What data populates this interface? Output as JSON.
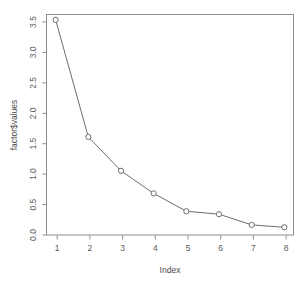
{
  "chart_data": {
    "type": "line",
    "title": "",
    "subtitle": "",
    "xlabel": "Index",
    "ylabel": "factor$values",
    "x": [
      1,
      2,
      3,
      4,
      5,
      6,
      7,
      8
    ],
    "values": [
      3.59,
      1.62,
      1.05,
      0.67,
      0.37,
      0.32,
      0.14,
      0.1
    ],
    "series": [
      {
        "name": "factor$values",
        "values": [
          3.59,
          1.62,
          1.05,
          0.67,
          0.37,
          0.32,
          0.14,
          0.1
        ]
      }
    ],
    "xtick_labels": [
      "1",
      "2",
      "3",
      "4",
      "5",
      "6",
      "7",
      "8"
    ],
    "ytick_labels": [
      "0.0",
      "0.5",
      "1.0",
      "1.5",
      "2.0",
      "2.5",
      "3.0",
      "3.5"
    ],
    "ytick_values": [
      0.0,
      0.5,
      1.0,
      1.5,
      2.0,
      2.5,
      3.0,
      3.5
    ],
    "xlim": [
      0.72,
      8.28
    ],
    "ylim": [
      -0.03,
      3.68
    ],
    "grid": false,
    "legend": false,
    "marker": "open-circle",
    "colors": {
      "line": "#6e6e6e",
      "marker_stroke": "#6e6e6e",
      "marker_fill": "#ffffff",
      "frame": "#8d8d8d",
      "text": "#5a5a5a",
      "background": "#ffffff"
    }
  },
  "axes": {
    "y": {
      "title": "factor$values",
      "ticks": [
        "0.0",
        "0.5",
        "1.0",
        "1.5",
        "2.0",
        "2.5",
        "3.0",
        "3.5"
      ]
    },
    "x": {
      "title": "Index",
      "ticks": [
        "1",
        "2",
        "3",
        "4",
        "5",
        "6",
        "7",
        "8"
      ]
    }
  }
}
